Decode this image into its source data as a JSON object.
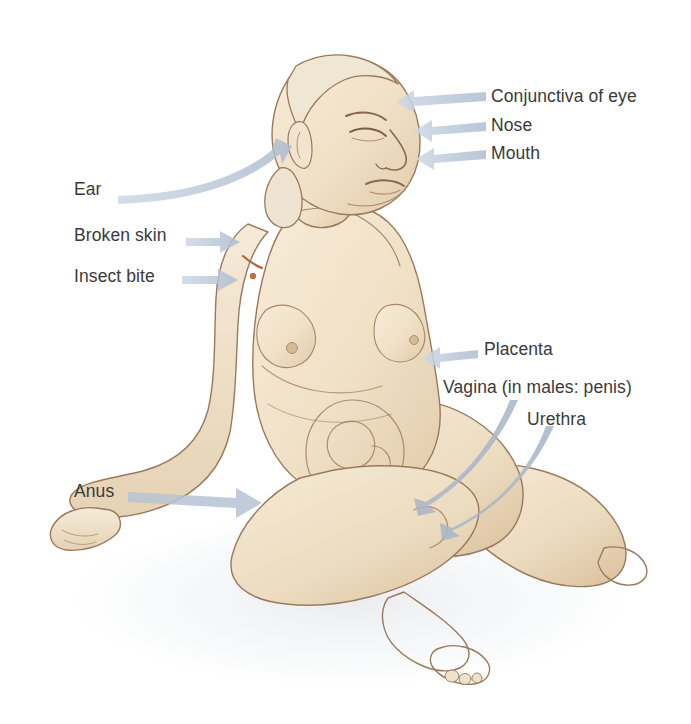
{
  "figure": {
    "background_color": "#ffffff",
    "width": 691,
    "height": 724,
    "skin_color": "#f1e3cb",
    "skin_shadow_color": "#dcc4a4",
    "outline_color": "#8a6a4e",
    "arrow_color": "#b9c6d8",
    "arrow_color_dark": "#97a3b3",
    "text_color": "#3a3a3a"
  },
  "labels": {
    "right": [
      {
        "id": "conjunctiva",
        "text": "Conjunctiva of eye"
      },
      {
        "id": "nose",
        "text": "Nose"
      },
      {
        "id": "mouth",
        "text": "Mouth"
      },
      {
        "id": "placenta",
        "text": "Placenta"
      },
      {
        "id": "vagina",
        "text": "Vagina (in males: penis)"
      },
      {
        "id": "urethra",
        "text": "Urethra"
      }
    ],
    "left": [
      {
        "id": "ear",
        "text": "Ear"
      },
      {
        "id": "broken_skin",
        "text": "Broken skin"
      },
      {
        "id": "insect_bite",
        "text": "Insect bite"
      },
      {
        "id": "anus",
        "text": "Anus"
      }
    ]
  },
  "annotations": {
    "shoulder_marks": "small reddish-brown broken-skin and insect-bite marks on the left shoulder",
    "abdomen": "faint line drawing of uterus and fetus visible through the lower abdomen"
  }
}
